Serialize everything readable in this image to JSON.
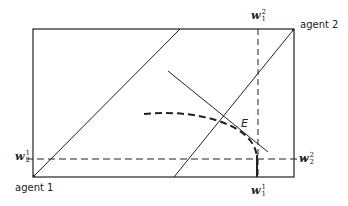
{
  "diagram": {
    "type": "edgeworth-box",
    "colors": {
      "line": "#222222",
      "background": "#ffffff"
    },
    "labels": {
      "agent_1": "agent 1",
      "agent_2": "agent 2",
      "E": "E",
      "w1_top": {
        "base": "w",
        "sup": "2",
        "sub": "1"
      },
      "w1_bottom": {
        "base": "w",
        "sup": "1",
        "sub": "1"
      },
      "w2_left": {
        "base": "w",
        "sup": "1",
        "sub": "2"
      },
      "w2_right": {
        "base": "w",
        "sup": "2",
        "sub": "2"
      }
    }
  }
}
